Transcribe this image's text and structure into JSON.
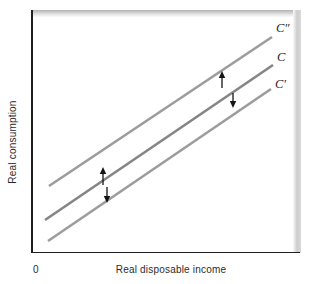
{
  "figure": {
    "y_axis_label": "Real consumption",
    "x_axis_label": "Real disposable income",
    "origin_label": "0"
  },
  "chart_data": {
    "type": "line",
    "title": "",
    "xlabel": "Real disposable income",
    "ylabel": "Real consumption",
    "legend": false,
    "grid": false,
    "axes_numeric": false,
    "lines": [
      {
        "label": "C″",
        "role": "shifted-up-consumption-function",
        "color": "#9c9c9c",
        "x1": 49,
        "y1": 186,
        "x2": 272,
        "y2": 37,
        "label_x": 276,
        "label_y": 21
      },
      {
        "label": "C",
        "role": "original-consumption-function",
        "color": "#858585",
        "x1": 45,
        "y1": 220,
        "x2": 273,
        "y2": 65,
        "label_x": 277,
        "label_y": 50
      },
      {
        "label": "C′",
        "role": "shifted-down-consumption-function",
        "color": "#9c9c9c",
        "x1": 48,
        "y1": 241,
        "x2": 271,
        "y2": 89,
        "label_x": 275,
        "label_y": 77
      }
    ],
    "arrows": [
      {
        "direction": "up",
        "x": 103,
        "y_tail": 185,
        "y_tip": 167
      },
      {
        "direction": "down",
        "x": 107,
        "y_tail": 187,
        "y_tip": 203
      },
      {
        "direction": "up",
        "x": 222,
        "y_tail": 88,
        "y_tip": 71
      },
      {
        "direction": "down",
        "x": 233,
        "y_tail": 93,
        "y_tip": 108
      }
    ],
    "style": {
      "line_width": 2.6,
      "axis_color": "#1f1f1f",
      "arrow_color": "#141414",
      "label_color": "#1e1e1e",
      "shadow_band_color": "#c9c9c9"
    }
  }
}
